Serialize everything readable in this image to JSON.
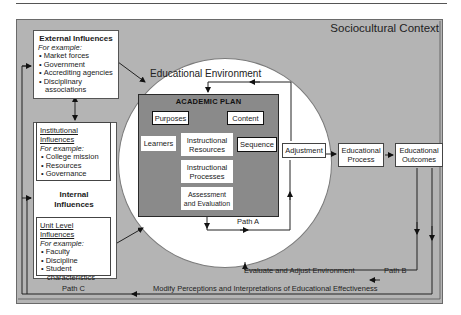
{
  "diagram": {
    "context_title": "Sociocultural Context",
    "environment_title": "Educational Environment",
    "external": {
      "title": "External Influences",
      "example_label": "For example:",
      "items": [
        "Market forces",
        "Government",
        "Accrediting agencies",
        "Disciplinary associations"
      ]
    },
    "internal": {
      "title": "Internal Influences",
      "institutional": {
        "title": "Institutional Influences",
        "example_label": "For example:",
        "items": [
          "College mission",
          "Resources",
          "Governance"
        ]
      },
      "unit": {
        "title": "Unit Level Influences",
        "example_label": "For example:",
        "items": [
          "Faculty",
          "Discipline",
          "Student characteristics"
        ]
      }
    },
    "academic_plan": {
      "title": "ACADEMIC PLAN",
      "elements": {
        "purposes": "Purposes",
        "content": "Content",
        "sequence": "Sequence",
        "learners": "Learners",
        "instructional_resources": "Instructional Resources",
        "instructional_processes": "Instructional Processes",
        "assessment": "Assessment and Evaluation"
      }
    },
    "flow": {
      "adjustment": "Adjustment",
      "educational_process": "Educational Process",
      "educational_outcomes": "Educational Outcomes"
    },
    "paths": {
      "path_a": "Path A",
      "path_b": "Path B",
      "path_c": "Path C",
      "evaluate_label": "Evaluate and Adjust Environment",
      "modify_label": "Modify Perceptions and Interpretations of Educational Effectiveness"
    },
    "colors": {
      "context_bg": "#b4b4b4",
      "environment_bg": "#ffffff",
      "plan_bg": "#8a8a8a",
      "line": "#222222"
    }
  }
}
